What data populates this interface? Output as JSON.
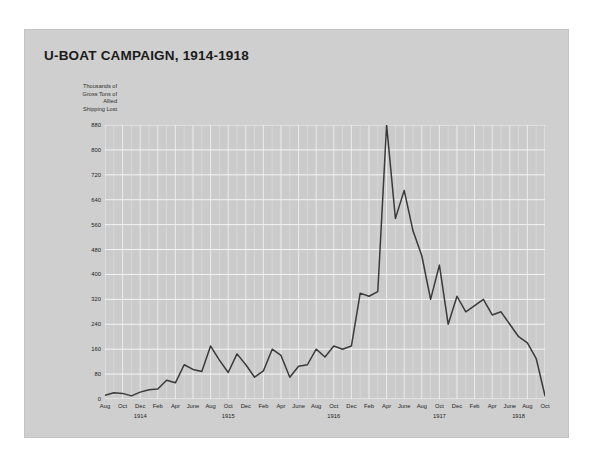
{
  "figure": {
    "title": "U-BOAT CAMPAIGN, 1914-1918",
    "axis_caption_lines": [
      "Thousands of",
      "Gross Tons of",
      "Allied",
      "Shipping Lost"
    ],
    "colors": {
      "page_background": "#ffffff",
      "card_background": "#cfcfcf",
      "plot_background": "#cbcbcb",
      "gridline": "#f0f0f0",
      "line": "#3a3a3a",
      "text": "#1b1b1b"
    }
  },
  "chart_data": {
    "type": "line",
    "title": "U-BOAT CAMPAIGN, 1914-1918",
    "xlabel": "",
    "ylabel": "Thousands of Gross Tons of Allied Shipping Lost",
    "ylim": [
      0,
      880
    ],
    "yticks": [
      0,
      80,
      160,
      240,
      320,
      400,
      480,
      560,
      640,
      720,
      800,
      880
    ],
    "grid": true,
    "legend": "none",
    "xtick_labels": [
      "Aug",
      "Oct",
      "Dec",
      "Feb",
      "Apr",
      "June",
      "Aug",
      "Oct",
      "Dec",
      "Feb",
      "Apr",
      "June",
      "Aug",
      "Oct",
      "Dec",
      "Feb",
      "Apr",
      "June",
      "Aug",
      "Oct",
      "Dec",
      "Feb",
      "Apr",
      "June",
      "Aug",
      "Oct"
    ],
    "year_labels": [
      "1914",
      "1915",
      "1916",
      "1917",
      "1918"
    ],
    "x": [
      "Aug 1914",
      "Sep 1914",
      "Oct 1914",
      "Nov 1914",
      "Dec 1914",
      "Jan 1915",
      "Feb 1915",
      "Mar 1915",
      "Apr 1915",
      "May 1915",
      "June 1915",
      "July 1915",
      "Aug 1915",
      "Sep 1915",
      "Oct 1915",
      "Nov 1915",
      "Dec 1915",
      "Jan 1916",
      "Feb 1916",
      "Mar 1916",
      "Apr 1916",
      "May 1916",
      "June 1916",
      "July 1916",
      "Aug 1916",
      "Sep 1916",
      "Oct 1916",
      "Nov 1916",
      "Dec 1916",
      "Jan 1917",
      "Feb 1917",
      "Mar 1917",
      "Apr 1917",
      "May 1917",
      "June 1917",
      "July 1917",
      "Aug 1917",
      "Sep 1917",
      "Oct 1917",
      "Nov 1917",
      "Dec 1917",
      "Jan 1918",
      "Feb 1918",
      "Mar 1918",
      "Apr 1918",
      "May 1918",
      "June 1918",
      "July 1918",
      "Aug 1918",
      "Sep 1918",
      "Oct 1918"
    ],
    "values": [
      12,
      20,
      18,
      10,
      22,
      30,
      32,
      60,
      52,
      110,
      95,
      88,
      170,
      125,
      85,
      145,
      110,
      70,
      90,
      160,
      140,
      70,
      105,
      110,
      160,
      135,
      170,
      160,
      170,
      340,
      330,
      345,
      880,
      580,
      670,
      540,
      460,
      320,
      430,
      240,
      330,
      280,
      300,
      320,
      270,
      280,
      240,
      200,
      180,
      130,
      10
    ]
  }
}
